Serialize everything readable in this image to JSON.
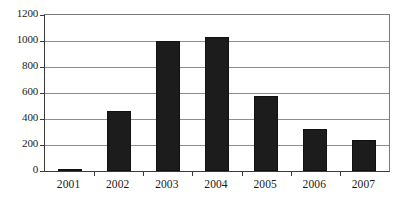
{
  "chart_data": {
    "type": "bar",
    "title": "",
    "subtitle": "",
    "xlabel": "",
    "ylabel": "",
    "categories": [
      "2001",
      "2002",
      "2003",
      "2004",
      "2005",
      "2006",
      "2007"
    ],
    "values": [
      12,
      460,
      1000,
      1030,
      580,
      320,
      238
    ],
    "ylim": [
      0,
      1200
    ],
    "yticks": [
      0,
      200,
      400,
      600,
      800,
      1000,
      1200
    ],
    "ytick_labels": [
      "0",
      "200",
      "400",
      "600",
      "800",
      "1000",
      "1200"
    ],
    "grid": true,
    "grid_axis": "y",
    "legend": false,
    "legend_position": "none",
    "series": [
      {
        "name": "",
        "values": [
          12,
          460,
          1000,
          1030,
          580,
          320,
          238
        ]
      }
    ],
    "colors": {
      "bar_fill": "#1c1c1c",
      "bar_edge": "#111111",
      "gridline": "#8d8d8d",
      "axis": "#3a3a3a",
      "frame": "#7a7a7a",
      "background": "#ffffff",
      "text": "#1a1a1a"
    }
  }
}
